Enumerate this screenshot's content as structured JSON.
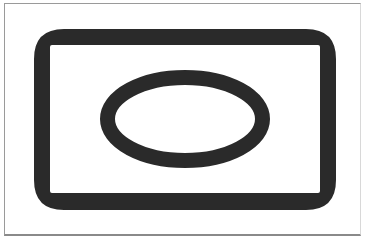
{
  "figure": {
    "stroke_color": "#2a2a2a",
    "background_color": "#ffffff",
    "frame_color": "#9a9a9a",
    "shapes": [
      {
        "type": "rounded-rectangle-ring",
        "outer": {
          "x": 34,
          "y": 29,
          "width": 302,
          "height": 181,
          "radius": 30
        },
        "inner": {
          "x": 50,
          "y": 45,
          "width": 270,
          "height": 148,
          "radius": 2
        }
      },
      {
        "type": "ellipse-ring",
        "cx": 185,
        "cy": 119,
        "rx": 85,
        "ry": 49,
        "stroke_width": 15
      }
    ]
  }
}
